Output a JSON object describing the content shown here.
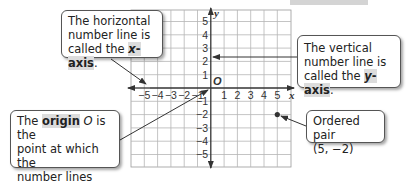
{
  "callouts": {
    "x_axis": {
      "line1": "The horizontal",
      "line2": "number line is",
      "line3_prefix": "called the ",
      "term_var": "x",
      "term_rest": "-axis",
      "line3_suffix": "."
    },
    "y_axis": {
      "line1": "The vertical",
      "line2": "number line is",
      "line3_prefix": "called the ",
      "term_var": "y",
      "term_rest": "-axis",
      "line3_suffix": "."
    },
    "origin": {
      "prefix": "The ",
      "term": "origin",
      "var": "O",
      "line1_suffix": " is the",
      "line2": "point at which the",
      "line3": "number lines",
      "line4": "intersect."
    },
    "ordered_pair": {
      "line1": "Ordered pair",
      "line2": "(5, −2)"
    }
  },
  "graph": {
    "x_label": "x",
    "y_label": "y",
    "origin_label": "O",
    "x_ticks_neg": [
      "−5",
      "−4",
      "−3",
      "−2",
      "−1"
    ],
    "x_ticks_pos": [
      "1",
      "2",
      "3",
      "4",
      "5"
    ],
    "y_ticks_pos": [
      "1",
      "2",
      "3",
      "4",
      "5"
    ],
    "y_ticks_neg": [
      "−1",
      "−2",
      "−3",
      "−4",
      "−5"
    ],
    "point": {
      "x": 5,
      "y": -2
    },
    "colors": {
      "grid": "#b5b5b5",
      "axis": "#333333",
      "highlight": "#dcdcdc"
    }
  }
}
